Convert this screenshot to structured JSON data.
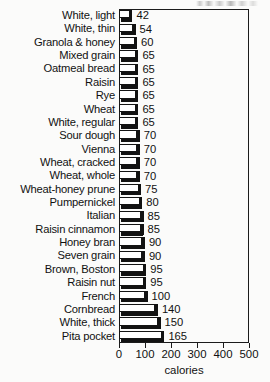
{
  "chart_data": {
    "type": "bar",
    "orientation": "horizontal",
    "title": "",
    "xlabel": "calories",
    "ylabel": "",
    "xlim": [
      0,
      500
    ],
    "xticks": [
      "0",
      "100",
      "200",
      "300",
      "400",
      "500"
    ],
    "grid": false,
    "legend": null,
    "categories": [
      "White, light",
      "White, thin",
      "Granola & honey",
      "Mixed grain",
      "Oatmeal bread",
      "Raisin",
      "Rye",
      "Wheat",
      "White, regular",
      "Sour dough",
      "Vienna",
      "Wheat, cracked",
      "Wheat, whole",
      "Wheat-honey prune",
      "Pumpernickel",
      "Italian",
      "Raisin cinnamon",
      "Honey bran",
      "Seven grain",
      "Brown, Boston",
      "Raisin nut",
      "French",
      "Cornbread",
      "White, thick",
      "Pita pocket"
    ],
    "values": [
      42,
      54,
      60,
      65,
      65,
      65,
      65,
      65,
      65,
      70,
      70,
      70,
      70,
      75,
      80,
      85,
      85,
      90,
      90,
      95,
      95,
      100,
      140,
      150,
      165
    ],
    "value_labels": [
      "42",
      "54",
      "60",
      "65",
      "65",
      "65",
      "65",
      "65",
      "65",
      "70",
      "70",
      "70",
      "70",
      "75",
      "80",
      "85",
      "85",
      "90",
      "90",
      "95",
      "95",
      "100",
      "140",
      "150",
      "165"
    ]
  },
  "axis": {
    "title": "calories"
  },
  "artifact": {
    "note": ""
  }
}
